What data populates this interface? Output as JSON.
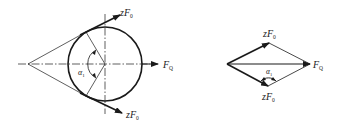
{
  "figure": {
    "left_diagram": {
      "description": "Belt pulley with belt wrap angle and resultant force",
      "labels": {
        "top_force": {
          "main": "zF",
          "sub": "0"
        },
        "bottom_force": {
          "main": "zF",
          "sub": "0"
        },
        "resultant": {
          "main": "F",
          "sub": "Q"
        },
        "angle": {
          "main": "α",
          "sub": "1"
        }
      },
      "geometry": {
        "apex": [
          28,
          64
        ],
        "circle_center": [
          105,
          64
        ],
        "circle_radius": 37,
        "tangent_top": [
          86,
          32
        ],
        "tangent_bottom": [
          86,
          96
        ],
        "top_arrow_tip": [
          120,
          15
        ],
        "bottom_arrow_tip": [
          122,
          113
        ],
        "resultant_arrow_tip": [
          158,
          64
        ]
      }
    },
    "right_diagram": {
      "description": "Force parallelogram (rhombus) of belt tensions",
      "labels": {
        "top_force": {
          "main": "zF",
          "sub": "0"
        },
        "bottom_force": {
          "main": "zF",
          "sub": "0"
        },
        "resultant": {
          "main": "F",
          "sub": "Q"
        },
        "angle": {
          "main": "α",
          "sub": "1"
        }
      },
      "geometry": {
        "left_vertex": [
          227,
          64
        ],
        "top_vertex": [
          269,
          43
        ],
        "right_vertex": [
          310,
          64
        ],
        "bottom_vertex": [
          268,
          86
        ]
      }
    },
    "colors": {
      "line": "#1a1a1a",
      "background": "#ffffff"
    }
  }
}
